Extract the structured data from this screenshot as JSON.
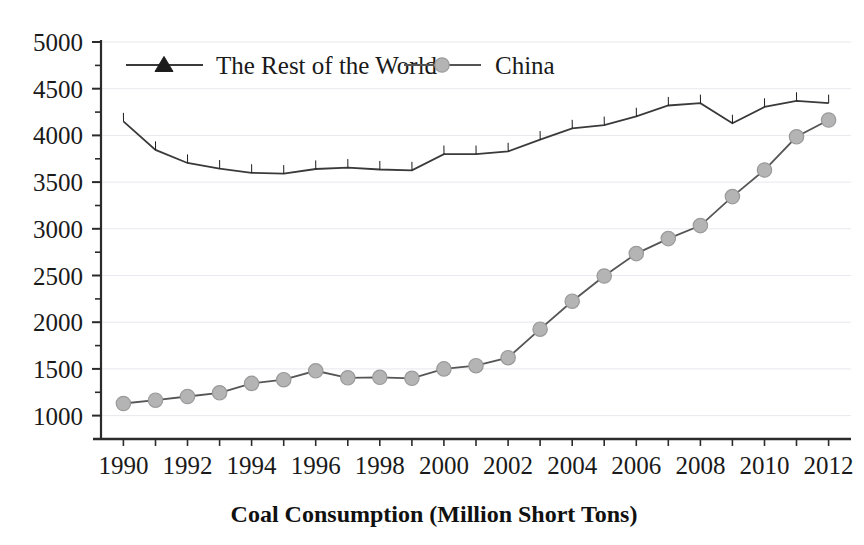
{
  "chart_data": {
    "type": "line",
    "title": "",
    "xlabel": "Coal Consumption (Million Short Tons)",
    "ylabel": "",
    "x": [
      1990,
      1991,
      1992,
      1993,
      1994,
      1995,
      1996,
      1997,
      1998,
      1999,
      2000,
      2001,
      2002,
      2003,
      2004,
      2005,
      2006,
      2007,
      2008,
      2009,
      2010,
      2011,
      2012
    ],
    "categories": [
      "1990",
      "1991",
      "1992",
      "1993",
      "1994",
      "1995",
      "1996",
      "1997",
      "1998",
      "1999",
      "2000",
      "2001",
      "2002",
      "2003",
      "2004",
      "2005",
      "2006",
      "2007",
      "2008",
      "2009",
      "2010",
      "2011",
      "2012"
    ],
    "xlim": [
      1989.3,
      2012.7
    ],
    "ylim": [
      750,
      5000
    ],
    "xticks": [
      1990,
      1991,
      1992,
      1993,
      1994,
      1995,
      1996,
      1997,
      1998,
      1999,
      2000,
      2001,
      2002,
      2003,
      2004,
      2005,
      2006,
      2007,
      2008,
      2009,
      2010,
      2011,
      2012
    ],
    "xtick_labels": [
      "1990",
      "",
      "1992",
      "",
      "1994",
      "",
      "1996",
      "",
      "1998",
      "",
      "2000",
      "",
      "2002",
      "",
      "2004",
      "",
      "2006",
      "",
      "2008",
      "",
      "2010",
      "",
      "2012"
    ],
    "yticks": [
      1000,
      1250,
      1500,
      1750,
      2000,
      2250,
      2500,
      2750,
      3000,
      3250,
      3500,
      3750,
      4000,
      4250,
      4500,
      4750,
      5000
    ],
    "ytick_labels": [
      "1000",
      "",
      "1500",
      "",
      "2000",
      "",
      "2500",
      "",
      "3000",
      "",
      "3500",
      "",
      "4000",
      "",
      "4500",
      "",
      "5000"
    ],
    "grid": "horizontal-major-faint",
    "legend_position": "top-inside",
    "series": [
      {
        "name": "The Rest of the World",
        "marker": "triangle",
        "marker_color": "#1c1c1c",
        "line_color": "#3a3a3a",
        "values": [
          4150,
          3845,
          3705,
          3645,
          3600,
          3590,
          3640,
          3655,
          3635,
          3625,
          3800,
          3800,
          3830,
          3955,
          4075,
          4110,
          4205,
          4320,
          4345,
          4130,
          4305,
          4370,
          4345
        ]
      },
      {
        "name": "China",
        "marker": "circle",
        "marker_color": "#b4b4b4",
        "line_color": "#555555",
        "values": [
          1130,
          1165,
          1205,
          1245,
          1345,
          1385,
          1480,
          1405,
          1410,
          1400,
          1500,
          1535,
          1620,
          1925,
          2225,
          2495,
          2735,
          2895,
          3035,
          3345,
          3630,
          3985,
          4165
        ]
      }
    ]
  },
  "legend": {
    "items": [
      {
        "label": "The Rest of the World"
      },
      {
        "label": "China"
      }
    ]
  },
  "axis": {
    "x_title": "Coal Consumption (Million Short Tons)"
  },
  "colors": {
    "background": "#ffffff",
    "axis": "#2b2b2b",
    "grid": "#e8e8ee",
    "world_marker": "#1c1c1c",
    "china_marker": "#b4b4b4"
  }
}
